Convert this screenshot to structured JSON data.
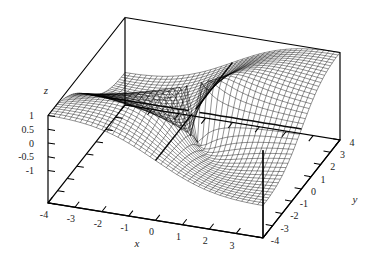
{
  "figure": {
    "background": "#ffffff",
    "mesh_color": "#000000",
    "border_color": "#000000"
  },
  "chart_data": {
    "type": "surface3d-wireframe",
    "function": "z = 2*x*y / (x^2 + y^2)",
    "projection": "orthographic",
    "view": {
      "rotation_x_deg": 60,
      "rotation_z_deg": 30
    },
    "base_plane_z": -2.18,
    "box_top_z": 1.0,
    "grid": {
      "points_per_axis": 41,
      "step": 0.2
    },
    "axes": {
      "x": {
        "title": "x",
        "range": [
          -4,
          4
        ],
        "tick_labels": [
          "-4",
          "-3",
          "-2",
          "-1",
          "0",
          "1",
          "2",
          "3"
        ],
        "tick_values": [
          -4,
          -3,
          -2,
          -1,
          0,
          1,
          2,
          3
        ],
        "tick_mark_values": [
          -4,
          -3,
          -2,
          -1,
          0,
          1,
          2,
          3,
          4
        ]
      },
      "y": {
        "title": "y",
        "range": [
          -4,
          4
        ],
        "tick_labels": [
          "-4",
          "-3",
          "-2",
          "-1",
          "0",
          "1",
          "2",
          "3",
          "4"
        ],
        "tick_values": [
          -4,
          -3,
          -2,
          -1,
          0,
          1,
          2,
          3,
          4
        ],
        "tick_mark_values": [
          -4,
          -3,
          -2,
          -1,
          0,
          1,
          2,
          3,
          4
        ]
      },
      "z": {
        "title": "z",
        "range": [
          -1,
          1
        ],
        "tick_labels": [
          "1",
          "0.5",
          "0",
          "-0.5",
          "-1"
        ],
        "tick_values": [
          1,
          0.5,
          0,
          -0.5,
          -1
        ]
      }
    },
    "highlighted_isolines": [
      "x=0",
      "y=0"
    ]
  }
}
